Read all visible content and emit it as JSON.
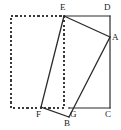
{
  "figure": {
    "type": "geometry-diagram",
    "width": 121,
    "height": 130,
    "background_color": "#ffffff",
    "stroke_color": "#2b2b2b",
    "dashed_stroke_color": "#3a3a3a",
    "label_color": "#1a1a1a",
    "labels": [
      {
        "id": "label-E",
        "text": "E",
        "x": 60,
        "y": 3
      },
      {
        "id": "label-D",
        "text": "D",
        "x": 104,
        "y": 3
      },
      {
        "id": "label-A",
        "text": "A",
        "x": 112,
        "y": 33
      },
      {
        "id": "label-F",
        "text": "F",
        "x": 36,
        "y": 110
      },
      {
        "id": "label-G",
        "text": "G",
        "x": 70,
        "y": 110
      },
      {
        "id": "label-B",
        "text": "B",
        "x": 64,
        "y": 119
      },
      {
        "id": "label-C",
        "text": "C",
        "x": 105,
        "y": 110
      }
    ],
    "points": {
      "E": {
        "x": 64,
        "y": 16
      },
      "D": {
        "x": 110,
        "y": 16
      },
      "A": {
        "x": 110,
        "y": 37
      },
      "C": {
        "x": 110,
        "y": 108
      },
      "G": {
        "x": 69,
        "y": 108
      },
      "F": {
        "x": 41,
        "y": 107
      },
      "B": {
        "x": 69,
        "y": 117
      }
    },
    "dashed_rect": {
      "x": 11,
      "y": 16,
      "width": 53,
      "height": 92
    },
    "solid_paths": [
      {
        "id": "edge-E-D",
        "from": "E",
        "to": "D"
      },
      {
        "id": "edge-D-C",
        "from": "D",
        "to": "C"
      },
      {
        "id": "edge-G-C",
        "from": "G",
        "to": "C"
      },
      {
        "id": "edge-E-A",
        "from": "E",
        "to": "A"
      },
      {
        "id": "edge-A-B",
        "from": "A",
        "to": "B"
      },
      {
        "id": "edge-B-F",
        "from": "B",
        "to": "F"
      },
      {
        "id": "edge-F-E",
        "from": "F",
        "to": "E"
      }
    ]
  }
}
